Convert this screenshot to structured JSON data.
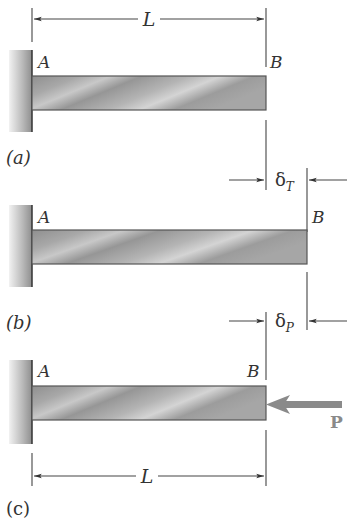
{
  "figure": {
    "panels": [
      {
        "id": "a",
        "caption": "(a)",
        "end_left": "A",
        "end_right": "B",
        "dimension_label": "L"
      },
      {
        "id": "b",
        "caption": "(b)",
        "end_left": "A",
        "end_right": "B",
        "displacement_label": "δ",
        "displacement_subscript": "T"
      },
      {
        "id": "c",
        "caption": "(c)",
        "end_left": "A",
        "end_right": "B",
        "load_label": "P",
        "dimension_label": "L",
        "displacement_label": "δ",
        "displacement_subscript": "P"
      }
    ],
    "colors": {
      "beam": "#9a9a9a",
      "wall": "#b5b5b5",
      "load_arrow": "#8a8a8a",
      "lines": "#444444"
    }
  }
}
